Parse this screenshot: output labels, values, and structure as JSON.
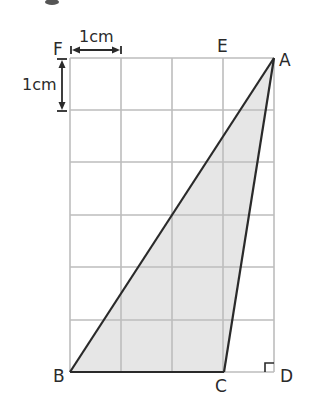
{
  "diagram": {
    "type": "geometry-grid",
    "grid": {
      "columns": 4,
      "rows": 6,
      "cell_size_cm": 1,
      "line_color": "#bdbdbd"
    },
    "scale": {
      "horizontal_label": "1cm",
      "vertical_label": "1cm"
    },
    "points": {
      "A": {
        "label": "A",
        "grid": [
          4,
          0
        ]
      },
      "B": {
        "label": "B",
        "grid": [
          0,
          6
        ]
      },
      "C": {
        "label": "C",
        "grid": [
          3,
          6
        ]
      },
      "D": {
        "label": "D",
        "grid": [
          4,
          6
        ]
      },
      "E": {
        "label": "E",
        "grid": [
          3,
          0
        ]
      },
      "F": {
        "label": "F",
        "grid": [
          0,
          0
        ]
      }
    },
    "triangle": {
      "vertices": [
        "A",
        "B",
        "C"
      ],
      "fill": "#e6e6e6",
      "stroke": "#2a2a2a"
    },
    "right_angle_marker": {
      "at": "D"
    },
    "colors": {
      "line": "#2a2a2a",
      "grid": "#bdbdbd",
      "shade": "#e6e6e6"
    }
  }
}
